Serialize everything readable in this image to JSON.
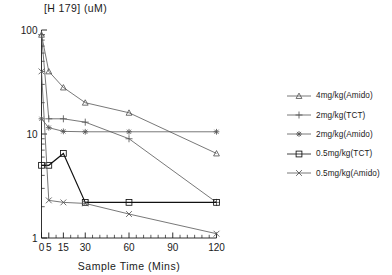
{
  "chart_data": {
    "type": "line",
    "title": "[H 179] (uM)",
    "xlabel": "Sample Time (Mins)",
    "ylabel": "",
    "yscale": "log",
    "ylim": [
      1,
      100
    ],
    "xlim": [
      0,
      120
    ],
    "grid": false,
    "legend_position": "right",
    "y_tick_labels": [
      "100",
      "10",
      "1"
    ],
    "y_tick_values": [
      100,
      10,
      1
    ],
    "x_tick_labels": [
      "0",
      "5",
      "15",
      "30",
      "60",
      "90",
      "120"
    ],
    "x_tick_values": [
      0,
      5,
      15,
      30,
      60,
      90,
      120
    ],
    "series": [
      {
        "name": "4mg/kg(Amido)",
        "marker": "triangle",
        "x": [
          0,
          5,
          15,
          30,
          60,
          120
        ],
        "values": [
          90,
          40,
          28,
          20,
          16,
          6.5
        ]
      },
      {
        "name": "2mg/kg(TCT)",
        "marker": "plus",
        "x": [
          0,
          5,
          15,
          30,
          60,
          120
        ],
        "values": [
          90,
          14,
          14,
          13,
          9,
          2.2
        ]
      },
      {
        "name": "2mg/kg(Amido)",
        "marker": "asterisk",
        "x": [
          0,
          5,
          15,
          30,
          60,
          120
        ],
        "values": [
          14,
          11.5,
          10.6,
          10.5,
          10.5,
          10.5
        ]
      },
      {
        "name": "0.5mg/kg(TCT)",
        "marker": "square",
        "x": [
          0,
          5,
          15,
          30,
          60,
          120
        ],
        "values": [
          5.0,
          5.0,
          6.5,
          2.2,
          2.2,
          2.2
        ]
      },
      {
        "name": "0.5mg/kg(Amido)",
        "marker": "x",
        "x": [
          0,
          5,
          15,
          30,
          60,
          120
        ],
        "values": [
          40,
          2.3,
          2.2,
          2.15,
          1.7,
          1.1
        ]
      }
    ]
  },
  "legend": {
    "items": [
      {
        "label": "4mg/kg(Amido)",
        "marker": "triangle"
      },
      {
        "label": "2mg/kg(TCT)",
        "marker": "plus"
      },
      {
        "label": "2mg/kg(Amido)",
        "marker": "asterisk"
      },
      {
        "label": "0.5mg/kg(TCT)",
        "marker": "square"
      },
      {
        "label": "0.5mg/kg(Amido)",
        "marker": "x"
      }
    ]
  },
  "colors": {
    "axis": "#1a1a1a",
    "series": "#555555",
    "emphasis": "#111111",
    "background": "#ffffff"
  }
}
